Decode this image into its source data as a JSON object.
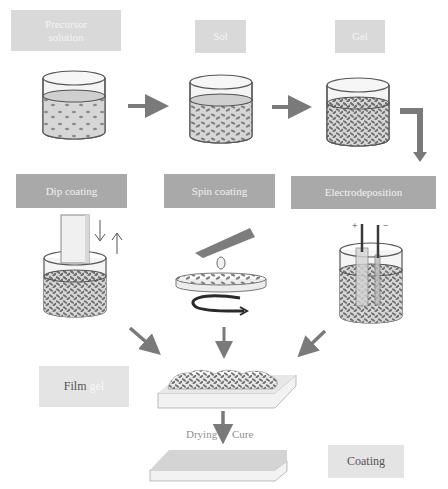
{
  "stages": {
    "precursor": {
      "line1": "Precursor",
      "line2": "solution"
    },
    "sol": "Sol",
    "gel": "Gel"
  },
  "methods": {
    "dip": "Dip coating",
    "spin": "Spin coating",
    "electro": "Electrodeposition",
    "electrode_plus": "+",
    "electrode_minus": "−"
  },
  "film": {
    "word": "Film",
    "suffix": "gel"
  },
  "process": {
    "drying": "Drying",
    "cure": "Cure"
  },
  "result": "Coating",
  "colors": {
    "arrow": "#7a7a7a",
    "box_light": "#d9d9d9",
    "box_dark": "#a9a9a9",
    "liquid": "#d6d6d6",
    "particle": "#7f7f7f"
  }
}
